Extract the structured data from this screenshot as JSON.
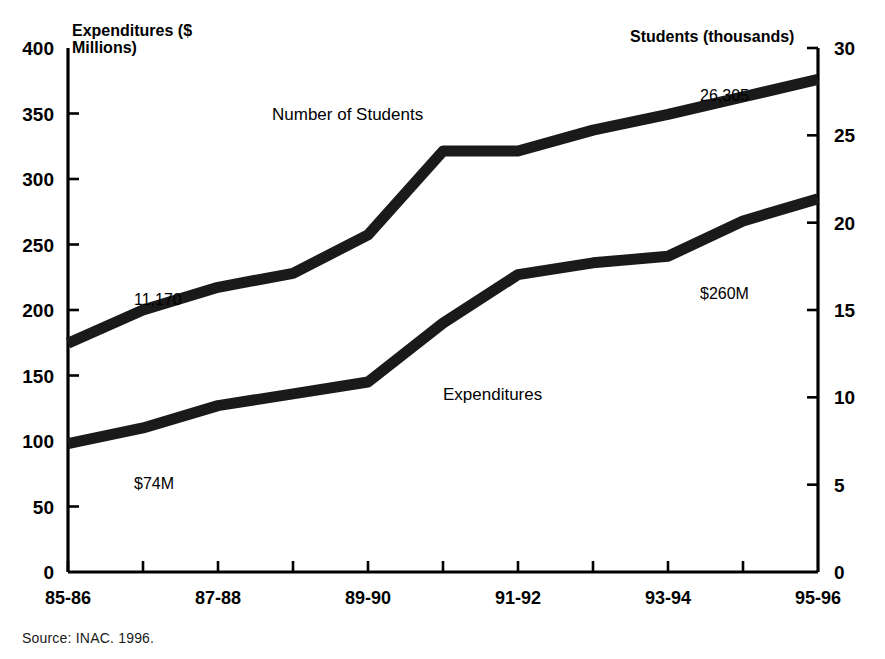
{
  "figure": {
    "source_note": "Source: INAC. 1996.",
    "left_axis_title": "Expenditures ($\nMillions)",
    "right_axis_title": "Students (thousands)"
  },
  "annotations": {
    "students_series_label": "Number of Students",
    "expenditures_series_label": "Expenditures",
    "students_start_value": "11,170",
    "students_end_value": "26,305",
    "expenditures_start_value": "$74M",
    "expenditures_end_value": "$260M"
  },
  "colors": {
    "line": "#1a1a1a",
    "axis": "#000000",
    "background": "#ffffff"
  },
  "chart_data": {
    "type": "line",
    "title": "",
    "xlabel": "",
    "grid": false,
    "legend": "inline-annotations",
    "categories": [
      "85-86",
      "86-87",
      "87-88",
      "88-89",
      "89-90",
      "90-91",
      "91-92",
      "92-93",
      "93-94",
      "94-95",
      "95-96"
    ],
    "xtick_labels_shown": [
      "85-86",
      "87-88",
      "89-90",
      "91-92",
      "93-94",
      "95-96"
    ],
    "axes": {
      "left": {
        "label": "Expenditures ($ Millions)",
        "ylim": [
          0,
          400
        ],
        "ticks": [
          0,
          50,
          100,
          150,
          200,
          250,
          300,
          350,
          400
        ],
        "tick_labels": [
          "0",
          "50",
          "100",
          "150",
          "200",
          "250",
          "300",
          "350",
          "400"
        ]
      },
      "right": {
        "label": "Students (thousands)",
        "ylim": [
          0,
          30
        ],
        "ticks": [
          0,
          5,
          10,
          15,
          20,
          25,
          30
        ],
        "tick_labels": [
          "0",
          "5",
          "10",
          "15",
          "20",
          "25",
          "30"
        ]
      }
    },
    "series": [
      {
        "name": "Number of Students",
        "axis": "right",
        "units": "thousands",
        "values": [
          13.1,
          15.0,
          16.3,
          17.1,
          19.3,
          24.1,
          24.1,
          25.3,
          26.2,
          27.2,
          28.2
        ],
        "labelled_points": [
          {
            "category": "85-86",
            "label": "11,170"
          },
          {
            "category": "94-95",
            "label": "26,305"
          }
        ]
      },
      {
        "name": "Expenditures",
        "axis": "left",
        "units": "$ Millions",
        "values": [
          98,
          110,
          127,
          136,
          145,
          190,
          227,
          236,
          241,
          268,
          285
        ],
        "labelled_points": [
          {
            "category": "85-86",
            "label": "$74M"
          },
          {
            "category": "94-95",
            "label": "$260M"
          }
        ]
      }
    ]
  }
}
